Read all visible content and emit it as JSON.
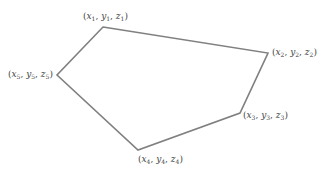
{
  "diagram": {
    "type": "polygon",
    "stroke_color": "#808080",
    "stroke_width": 1.6,
    "vertices": [
      {
        "id": 1,
        "x": 103,
        "y": 27,
        "label": "(x1, y1, z1)",
        "var_x": "x",
        "var_y": "y",
        "var_z": "z",
        "sub": "1",
        "label_left": 83,
        "label_top": 12
      },
      {
        "id": 2,
        "x": 268,
        "y": 53,
        "label": "(x2, y2, z2)",
        "var_x": "x",
        "var_y": "y",
        "var_z": "z",
        "sub": "2",
        "label_left": 272,
        "label_top": 48
      },
      {
        "id": 3,
        "x": 240,
        "y": 113,
        "label": "(x3, y3, z3)",
        "var_x": "x",
        "var_y": "y",
        "var_z": "z",
        "sub": "3",
        "label_left": 243,
        "label_top": 111
      },
      {
        "id": 4,
        "x": 138,
        "y": 150,
        "label": "(x4, y4, z4)",
        "var_x": "x",
        "var_y": "y",
        "var_z": "z",
        "sub": "4",
        "label_left": 138,
        "label_top": 155
      },
      {
        "id": 5,
        "x": 57,
        "y": 75,
        "label": "(x5, y5, z5)",
        "var_x": "x",
        "var_y": "y",
        "var_z": "z",
        "sub": "5",
        "label_left": 8,
        "label_top": 70
      }
    ]
  }
}
